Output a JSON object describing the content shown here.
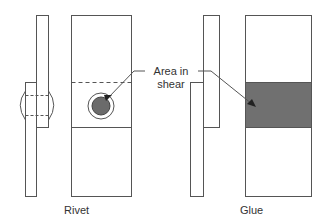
{
  "diagram": {
    "label": "Area in shear",
    "label_line1": "Area in",
    "label_line2": "shear",
    "panels": [
      {
        "name": "rivet",
        "caption": "Rivet"
      },
      {
        "name": "glue",
        "caption": "Glue"
      }
    ],
    "colors": {
      "stroke": "#555555",
      "rivet_fill": "#6b6b6b",
      "glue_fill": "#707070",
      "background": "#ffffff"
    }
  }
}
